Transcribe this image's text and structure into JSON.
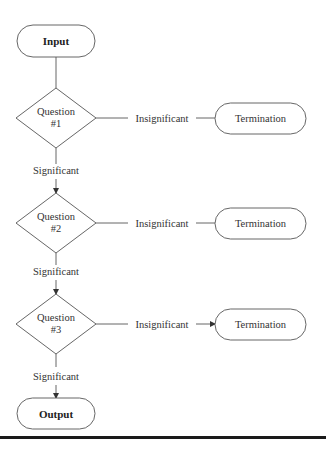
{
  "diagram": {
    "start": {
      "label": "Input"
    },
    "end": {
      "label": "Output"
    },
    "questions": [
      {
        "line1": "Question",
        "line2": "#1",
        "no_label": "Insignificant",
        "yes_label": "Significant",
        "termination": "Termination"
      },
      {
        "line1": "Question",
        "line2": "#2",
        "no_label": "Insignificant",
        "yes_label": "Significant",
        "termination": "Termination"
      },
      {
        "line1": "Question",
        "line2": "#3",
        "no_label": "Insignificant",
        "yes_label": "Significant",
        "termination": "Termination"
      }
    ],
    "colors": {
      "stroke": "#555555",
      "rule": "#1a1a1a",
      "background": "#ffffff"
    }
  }
}
